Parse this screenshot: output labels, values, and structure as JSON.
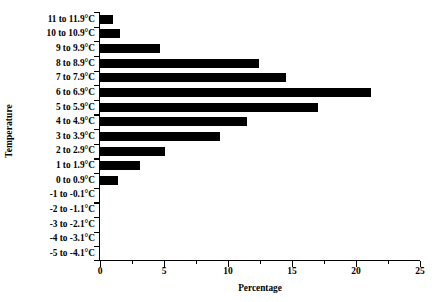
{
  "chart_data": {
    "type": "bar",
    "orientation": "horizontal",
    "title": "",
    "xlabel": "Percentage",
    "ylabel": "Temperature",
    "xlim": [
      0,
      25
    ],
    "xticks": [
      0,
      5,
      10,
      15,
      20,
      25
    ],
    "xtick_labels": [
      "0",
      "5",
      "10",
      "15",
      "20",
      "25"
    ],
    "minor_xticks": [
      2.5,
      7.5,
      12.5,
      17.5,
      22.5
    ],
    "grid": false,
    "legend": false,
    "bar_color": "#000000",
    "background_color": "#ffffff",
    "axis_color": "#000000",
    "categories": [
      "11 to 11.9°C",
      "10 to 10.9°C",
      "9 to 9.9°C",
      "8 to 8.9°C",
      "7 to 7.9°C",
      "6 to 6.9°C",
      "5 to 5.9°C",
      "4 to 4.9°C",
      "3 to 3.9°C",
      "2 to 2.9°C",
      "1 to 1.9°C",
      "0 to 0.9°C",
      "-1 to -0.1°C",
      "-2 to -1.1°C",
      "-3 to -2.1°C",
      "-4 to -3.1°C",
      "-5 to -4.1°C"
    ],
    "values": [
      1.0,
      1.6,
      4.7,
      12.4,
      14.5,
      21.2,
      17.0,
      11.5,
      9.4,
      5.1,
      3.1,
      1.4,
      0,
      0,
      0,
      0,
      0
    ]
  }
}
